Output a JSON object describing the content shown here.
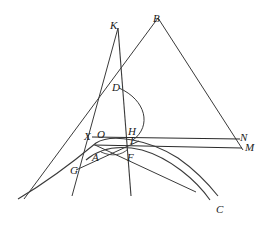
{
  "figure": {
    "canvas": {
      "width": 270,
      "height": 235
    },
    "stroke_color": "#3a3a3a",
    "stroke_color_dark": "#2b2b2b",
    "background_color": "#ffffff",
    "label_color": "#1a1a1a"
  },
  "labels": [
    {
      "id": "K",
      "text": "K",
      "x": 110,
      "y": 20
    },
    {
      "id": "B",
      "text": "B",
      "x": 153,
      "y": 13
    },
    {
      "id": "D",
      "text": "D",
      "x": 112,
      "y": 82
    },
    {
      "id": "H",
      "text": "H",
      "x": 128,
      "y": 126
    },
    {
      "id": "I",
      "text": "I",
      "x": 130,
      "y": 135
    },
    {
      "id": "N",
      "text": "N",
      "x": 240,
      "y": 132
    },
    {
      "id": "M",
      "text": "M",
      "x": 245,
      "y": 142
    },
    {
      "id": "X",
      "text": "X",
      "x": 84,
      "y": 131
    },
    {
      "id": "O",
      "text": "O",
      "x": 97,
      "y": 129
    },
    {
      "id": "A",
      "text": "A",
      "x": 92,
      "y": 152
    },
    {
      "id": "F",
      "text": "F",
      "x": 127,
      "y": 152
    },
    {
      "id": "G",
      "text": "G",
      "x": 70,
      "y": 165
    },
    {
      "id": "C",
      "text": "C",
      "x": 216,
      "y": 204
    }
  ],
  "points": {
    "K": {
      "x": 118,
      "y": 28
    },
    "B_end": {
      "x": 158,
      "y": 18
    },
    "D": {
      "x": 118,
      "y": 87
    },
    "X": {
      "x": 94,
      "y": 137
    },
    "O": {
      "x": 104,
      "y": 138
    },
    "H": {
      "x": 131,
      "y": 133
    },
    "I": {
      "x": 131,
      "y": 140
    },
    "A": {
      "x": 99,
      "y": 147
    },
    "F": {
      "x": 131,
      "y": 147
    },
    "N": {
      "x": 238,
      "y": 140
    },
    "M": {
      "x": 240,
      "y": 147
    },
    "G": {
      "x": 81,
      "y": 158
    },
    "C_end": {
      "x": 210,
      "y": 200
    },
    "vertical_bottom": {
      "x": 131,
      "y": 196
    }
  },
  "geometry": {
    "vertical_axis": {
      "x1": 118,
      "y1": 28,
      "x2": 131,
      "y2": 196
    },
    "segments": [
      {
        "name": "line-K-to-lower-left",
        "x1": 118,
        "y1": 28,
        "x2": 72,
        "y2": 196
      },
      {
        "name": "line-B-to-N",
        "x1": 158,
        "y1": 18,
        "x2": 243,
        "y2": 150
      },
      {
        "name": "line-B-through-D-to-lower-left",
        "x1": 158,
        "y1": 18,
        "x2": 24,
        "y2": 199
      },
      {
        "name": "line-X-to-N-upper",
        "x1": 92,
        "y1": 137,
        "x2": 240,
        "y2": 139
      },
      {
        "name": "line-A-to-M-lower",
        "x1": 94,
        "y1": 145,
        "x2": 242,
        "y2": 148
      },
      {
        "name": "line-G-to-F-area",
        "x1": 76,
        "y1": 170,
        "x2": 139,
        "y2": 141
      },
      {
        "name": "line-A-descending-right",
        "x1": 95,
        "y1": 145,
        "x2": 196,
        "y2": 192
      }
    ],
    "curves": [
      {
        "name": "conic-main-through-X",
        "d": "M 18,199 C 50,180 78,158 96,143 C 112,133 150,140 178,158 C 198,172 210,186 218,196"
      },
      {
        "name": "conic-lower-through-A",
        "d": "M 86,160 C 100,148 120,145 142,150 C 170,158 196,180 210,200"
      },
      {
        "name": "arc-D-to-I",
        "d": "M 119,88 C 146,100 152,126 133,140"
      },
      {
        "name": "arc-small-A-F",
        "d": "M 101,152 C 112,157 122,155 128,149"
      }
    ]
  }
}
